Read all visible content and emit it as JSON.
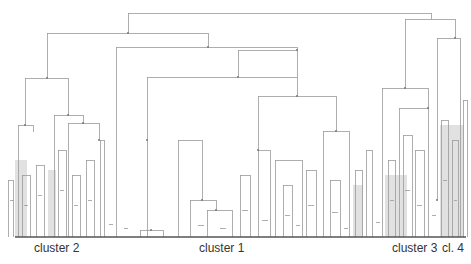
{
  "diagram": {
    "type": "dendrogram",
    "colors": {
      "line": "#9a9a9a",
      "shade": "#c8c8c8",
      "baseline": "#555555",
      "label": "#333333"
    },
    "baseline_y": 237,
    "cluster_labels": [
      {
        "text": "cluster 2",
        "x": 34
      },
      {
        "text": "cluster 1",
        "x": 199
      },
      {
        "text": "cluster 3",
        "x": 392
      },
      {
        "text": "cl. 4",
        "x": 442
      }
    ],
    "shaded_regions": [
      {
        "x": 15,
        "y": 160,
        "w": 12,
        "h": 77
      },
      {
        "x": 48,
        "y": 170,
        "w": 8,
        "h": 67
      },
      {
        "x": 385,
        "y": 175,
        "w": 22,
        "h": 62
      },
      {
        "x": 440,
        "y": 125,
        "w": 24,
        "h": 112
      },
      {
        "x": 353,
        "y": 185,
        "w": 10,
        "h": 52
      }
    ],
    "links": [
      [
        128,
        13,
        431,
        13
      ],
      [
        128,
        13,
        128,
        33
      ],
      [
        431,
        13,
        431,
        19
      ],
      [
        47,
        33,
        208,
        33
      ],
      [
        47,
        33,
        47,
        78
      ],
      [
        208,
        33,
        208,
        47
      ],
      [
        405,
        19,
        455,
        19
      ],
      [
        405,
        19,
        405,
        88
      ],
      [
        455,
        19,
        455,
        38
      ],
      [
        25,
        78,
        68,
        78
      ],
      [
        25,
        78,
        25,
        125
      ],
      [
        68,
        78,
        68,
        115
      ],
      [
        116,
        47,
        297,
        47
      ],
      [
        116,
        47,
        116,
        237
      ],
      [
        297,
        47,
        297,
        50
      ],
      [
        238,
        50,
        297,
        50
      ],
      [
        238,
        50,
        238,
        77
      ],
      [
        297,
        50,
        297,
        77
      ],
      [
        18,
        125,
        33,
        125
      ],
      [
        18,
        125,
        18,
        237
      ],
      [
        33,
        125,
        33,
        132
      ],
      [
        54,
        115,
        83,
        115
      ],
      [
        54,
        115,
        54,
        237
      ],
      [
        83,
        115,
        83,
        123
      ],
      [
        68,
        123,
        99,
        123
      ],
      [
        68,
        123,
        68,
        237
      ],
      [
        99,
        123,
        99,
        140
      ],
      [
        147,
        77,
        297,
        77
      ],
      [
        147,
        77,
        147,
        237
      ],
      [
        297,
        77,
        297,
        96
      ],
      [
        178,
        140,
        202,
        140
      ],
      [
        178,
        140,
        178,
        237
      ],
      [
        202,
        140,
        202,
        200
      ],
      [
        258,
        96,
        336,
        96
      ],
      [
        258,
        96,
        258,
        150
      ],
      [
        336,
        96,
        336,
        131
      ],
      [
        323,
        131,
        349,
        131
      ],
      [
        323,
        131,
        323,
        237
      ],
      [
        349,
        131,
        349,
        237
      ],
      [
        437,
        38,
        460,
        38
      ],
      [
        437,
        38,
        437,
        200
      ],
      [
        460,
        38,
        460,
        237
      ],
      [
        382,
        88,
        428,
        88
      ],
      [
        382,
        88,
        382,
        237
      ],
      [
        428,
        88,
        428,
        108
      ],
      [
        399,
        108,
        428,
        108
      ],
      [
        399,
        108,
        399,
        237
      ],
      [
        428,
        108,
        428,
        237
      ],
      [
        258,
        150,
        270,
        150
      ],
      [
        258,
        150,
        258,
        237
      ],
      [
        270,
        150,
        270,
        237
      ],
      [
        275,
        160,
        302,
        160
      ],
      [
        275,
        160,
        275,
        237
      ],
      [
        302,
        160,
        302,
        237
      ],
      [
        190,
        200,
        216,
        200
      ],
      [
        190,
        200,
        190,
        237
      ],
      [
        216,
        200,
        216,
        210
      ],
      [
        207,
        210,
        232,
        210
      ],
      [
        207,
        210,
        207,
        237
      ],
      [
        232,
        210,
        232,
        237
      ],
      [
        140,
        230,
        163,
        230
      ],
      [
        140,
        230,
        140,
        237
      ],
      [
        163,
        230,
        163,
        237
      ],
      [
        8,
        180,
        13,
        180
      ],
      [
        8,
        180,
        8,
        237
      ],
      [
        13,
        180,
        13,
        237
      ],
      [
        22,
        175,
        30,
        175
      ],
      [
        22,
        175,
        22,
        237
      ],
      [
        30,
        175,
        30,
        237
      ],
      [
        36,
        165,
        44,
        165
      ],
      [
        36,
        165,
        36,
        237
      ],
      [
        44,
        165,
        44,
        237
      ],
      [
        58,
        150,
        66,
        150
      ],
      [
        58,
        150,
        58,
        237
      ],
      [
        66,
        150,
        66,
        237
      ],
      [
        72,
        175,
        80,
        175
      ],
      [
        72,
        175,
        72,
        237
      ],
      [
        80,
        175,
        80,
        237
      ],
      [
        86,
        160,
        94,
        160
      ],
      [
        86,
        160,
        86,
        237
      ],
      [
        94,
        160,
        94,
        237
      ],
      [
        100,
        140,
        104,
        140
      ],
      [
        100,
        140,
        100,
        237
      ],
      [
        104,
        140,
        104,
        237
      ],
      [
        240,
        175,
        250,
        175
      ],
      [
        240,
        175,
        240,
        237
      ],
      [
        250,
        175,
        250,
        237
      ],
      [
        283,
        185,
        292,
        185
      ],
      [
        283,
        185,
        283,
        237
      ],
      [
        292,
        185,
        292,
        237
      ],
      [
        306,
        170,
        316,
        170
      ],
      [
        306,
        170,
        306,
        237
      ],
      [
        316,
        170,
        316,
        237
      ],
      [
        330,
        180,
        340,
        180
      ],
      [
        330,
        180,
        330,
        237
      ],
      [
        340,
        180,
        340,
        237
      ],
      [
        355,
        170,
        362,
        170
      ],
      [
        355,
        170,
        355,
        237
      ],
      [
        362,
        170,
        362,
        237
      ],
      [
        366,
        150,
        372,
        150
      ],
      [
        366,
        150,
        366,
        237
      ],
      [
        372,
        150,
        372,
        237
      ],
      [
        388,
        160,
        395,
        160
      ],
      [
        388,
        160,
        388,
        237
      ],
      [
        395,
        160,
        395,
        237
      ],
      [
        403,
        135,
        412,
        135
      ],
      [
        403,
        135,
        403,
        237
      ],
      [
        412,
        135,
        412,
        237
      ],
      [
        415,
        150,
        424,
        150
      ],
      [
        415,
        150,
        415,
        237
      ],
      [
        424,
        150,
        424,
        237
      ],
      [
        441,
        120,
        448,
        120
      ],
      [
        441,
        120,
        441,
        237
      ],
      [
        448,
        120,
        448,
        237
      ],
      [
        452,
        140,
        458,
        140
      ],
      [
        452,
        140,
        452,
        237
      ],
      [
        458,
        140,
        458,
        237
      ],
      [
        463,
        100,
        467,
        100
      ],
      [
        463,
        100,
        463,
        237
      ],
      [
        467,
        100,
        467,
        237
      ],
      [
        10,
        200,
        14,
        200
      ],
      [
        24,
        205,
        28,
        205
      ],
      [
        38,
        195,
        42,
        195
      ],
      [
        60,
        190,
        64,
        190
      ],
      [
        74,
        205,
        78,
        205
      ],
      [
        88,
        200,
        92,
        200
      ],
      [
        242,
        210,
        248,
        210
      ],
      [
        285,
        215,
        290,
        215
      ],
      [
        308,
        205,
        314,
        205
      ],
      [
        332,
        212,
        338,
        212
      ],
      [
        390,
        200,
        394,
        200
      ],
      [
        405,
        190,
        410,
        190
      ],
      [
        417,
        205,
        422,
        205
      ],
      [
        443,
        180,
        447,
        180
      ],
      [
        454,
        200,
        457,
        200
      ],
      [
        198,
        225,
        204,
        225
      ],
      [
        220,
        228,
        226,
        228
      ],
      [
        262,
        220,
        268,
        220
      ],
      [
        296,
        225,
        300,
        225
      ],
      [
        344,
        228,
        348,
        228
      ],
      [
        376,
        222,
        380,
        222
      ],
      [
        432,
        215,
        436,
        215
      ],
      [
        109,
        224,
        113,
        224
      ],
      [
        124,
        228,
        128,
        228
      ]
    ],
    "nodes": [
      [
        128,
        33
      ],
      [
        208,
        47
      ],
      [
        405,
        88
      ],
      [
        455,
        38
      ],
      [
        297,
        50
      ],
      [
        238,
        77
      ],
      [
        68,
        115
      ],
      [
        47,
        78
      ],
      [
        147,
        140
      ],
      [
        297,
        96
      ],
      [
        336,
        131
      ],
      [
        258,
        150
      ],
      [
        428,
        108
      ],
      [
        202,
        200
      ],
      [
        216,
        210
      ],
      [
        151,
        230
      ],
      [
        25,
        125
      ],
      [
        83,
        123
      ],
      [
        99,
        140
      ],
      [
        437,
        200
      ]
    ]
  }
}
